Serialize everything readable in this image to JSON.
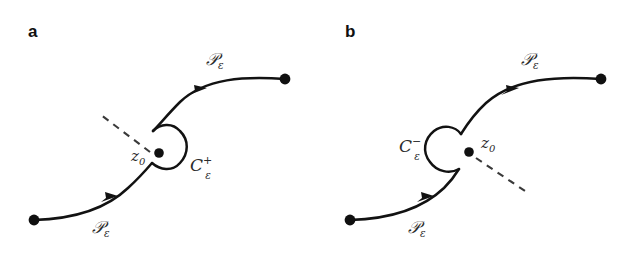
{
  "figure": {
    "background_color": "#ffffff",
    "ink_color": "#121212",
    "label_color": "#2b2b2b",
    "width": 637,
    "height": 253
  },
  "panels": [
    {
      "id": "a",
      "letter": "a",
      "contour_label_base": "C",
      "contour_label_sub": "ε",
      "contour_label_sup": "+",
      "pole_label_base": "z",
      "pole_label_sub": "0",
      "path_label_base": "𝒫",
      "path_label_sub": "ε",
      "path_label_upper": "𝒫",
      "path_label_lower": "𝒫",
      "indentation_side": "right",
      "branch_cut_direction": "up-left",
      "arrow_count": 2,
      "endpoint_count": 2
    },
    {
      "id": "b",
      "letter": "b",
      "contour_label_base": "C",
      "contour_label_sub": "ε",
      "contour_label_sup": "−",
      "pole_label_base": "z",
      "pole_label_sub": "0",
      "path_label_base": "𝒫",
      "path_label_sub": "ε",
      "path_label_upper": "𝒫",
      "path_label_lower": "𝒫",
      "indentation_side": "left",
      "branch_cut_direction": "down-right",
      "arrow_count": 2,
      "endpoint_count": 2
    }
  ]
}
